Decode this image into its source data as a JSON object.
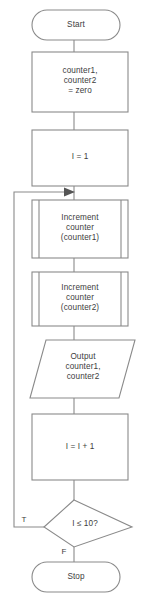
{
  "diagram": {
    "type": "flowchart",
    "colors": {
      "stroke": "#8a8a8a",
      "text": "#3d3d3d",
      "background": "#ffffff",
      "arrow": "#555555"
    },
    "nodes": [
      {
        "id": "start",
        "shape": "terminator",
        "label": "Start"
      },
      {
        "id": "init-counters",
        "shape": "process",
        "label": "counter1,\ncounter2\n= zero"
      },
      {
        "id": "init-index",
        "shape": "process",
        "label": "I = 1"
      },
      {
        "id": "increment-counter1",
        "shape": "subroutine",
        "label": "Increment\ncounter\n(counter1)"
      },
      {
        "id": "increment-counter2",
        "shape": "subroutine",
        "label": "Increment\ncounter\n(counter2)"
      },
      {
        "id": "output-counters",
        "shape": "input-output",
        "label": "Output\ncounter1,\ncounter2"
      },
      {
        "id": "increment-index",
        "shape": "process",
        "label": "I = I + 1"
      },
      {
        "id": "condition",
        "shape": "decision",
        "label": "I ≤ 10?"
      },
      {
        "id": "stop",
        "shape": "terminator",
        "label": "Stop"
      }
    ],
    "branch_labels": {
      "true": "T",
      "false": "F"
    },
    "edges": [
      {
        "from": "start",
        "to": "init-counters",
        "label": ""
      },
      {
        "from": "init-counters",
        "to": "init-index",
        "label": ""
      },
      {
        "from": "init-index",
        "to": "increment-counter1",
        "label": ""
      },
      {
        "from": "increment-counter1",
        "to": "increment-counter2",
        "label": ""
      },
      {
        "from": "increment-counter2",
        "to": "output-counters",
        "label": ""
      },
      {
        "from": "output-counters",
        "to": "increment-index",
        "label": ""
      },
      {
        "from": "increment-index",
        "to": "condition",
        "label": ""
      },
      {
        "from": "condition",
        "to": "increment-counter1",
        "label": "T"
      },
      {
        "from": "condition",
        "to": "stop",
        "label": "F"
      }
    ]
  }
}
